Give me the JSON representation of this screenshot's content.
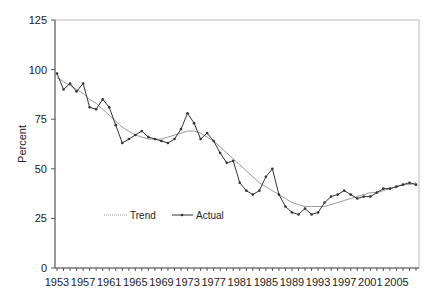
{
  "chart_data": {
    "type": "line",
    "title": "",
    "xlabel": "",
    "ylabel": "Percent",
    "ylim": [
      0,
      125
    ],
    "yticks": [
      0,
      25,
      50,
      75,
      100,
      125
    ],
    "xtick_labels": [
      "1953",
      "1957",
      "1961",
      "1965",
      "1969",
      "1973",
      "1977",
      "1981",
      "1985",
      "1989",
      "1993",
      "1997",
      "2001",
      "2005"
    ],
    "grid": false,
    "legend_position": "inside lower left",
    "x": [
      1953,
      1954,
      1955,
      1956,
      1957,
      1958,
      1959,
      1960,
      1961,
      1962,
      1963,
      1964,
      1965,
      1966,
      1967,
      1968,
      1969,
      1970,
      1971,
      1972,
      1973,
      1974,
      1975,
      1976,
      1977,
      1978,
      1979,
      1980,
      1981,
      1982,
      1983,
      1984,
      1985,
      1986,
      1987,
      1988,
      1989,
      1990,
      1991,
      1992,
      1993,
      1994,
      1995,
      1996,
      1997,
      1998,
      1999,
      2000,
      2001,
      2002,
      2003,
      2004,
      2005,
      2006,
      2007,
      2008
    ],
    "series": [
      {
        "name": "Actual",
        "style": "solid line with point markers",
        "color": "#333333",
        "values": [
          98,
          90,
          93,
          89,
          93,
          81,
          80,
          85,
          81,
          72,
          63,
          65,
          67,
          69,
          66,
          65,
          64,
          63,
          65,
          70,
          78,
          73,
          65,
          68,
          64,
          58,
          53,
          54,
          43,
          39,
          37,
          39,
          46,
          50,
          37,
          31,
          28,
          27,
          30,
          27,
          28,
          33,
          36,
          37,
          39,
          37,
          35,
          36,
          36,
          38,
          40,
          40,
          41,
          42,
          43,
          42
        ]
      },
      {
        "name": "Trend",
        "style": "thin dotted/light line",
        "color": "#999999",
        "values": [
          96,
          94,
          92,
          90,
          88,
          85,
          83,
          80,
          77,
          74,
          71,
          69,
          67,
          66,
          65,
          65,
          65,
          66,
          67,
          68,
          69,
          69,
          68,
          66,
          64,
          61,
          58,
          55,
          52,
          49,
          46,
          43,
          41,
          39,
          37,
          35,
          33,
          32,
          31,
          31,
          31,
          31,
          32,
          33,
          34,
          35,
          36,
          37,
          38,
          38,
          39,
          40,
          41,
          42,
          42,
          43
        ]
      }
    ]
  },
  "legend": {
    "trend_label": "Trend",
    "actual_label": "Actual"
  },
  "axis": {
    "ylabel": "Percent"
  }
}
